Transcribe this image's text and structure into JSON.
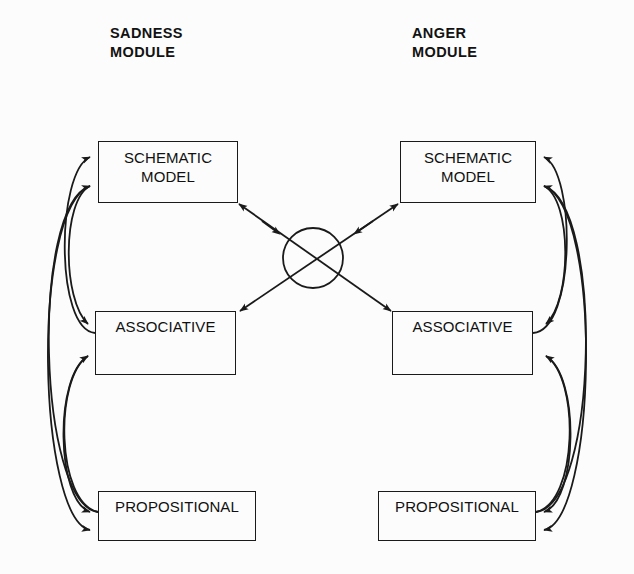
{
  "figure": {
    "background_color": "#fcfcfc",
    "stroke_color": "#1a1a1a",
    "text_color": "#101010"
  },
  "modules": {
    "left": {
      "title": "SADNESS\nMODULE",
      "nodes": {
        "schematic": "SCHEMATIC\nMODEL",
        "associative": "ASSOCIATIVE",
        "propositional": "PROPOSITIONAL"
      }
    },
    "right": {
      "title": "ANGER\nMODULE",
      "nodes": {
        "schematic": "SCHEMATIC\nMODEL",
        "associative": "ASSOCIATIVE",
        "propositional": "PROPOSITIONAL"
      }
    }
  },
  "crossing": {
    "label": "",
    "center_x": 313,
    "center_y": 258,
    "radius": 30
  },
  "diagram_data": {
    "type": "diagram",
    "title": "Sadness and Anger Module Interaction",
    "node_levels": [
      "SCHEMATIC MODEL",
      "ASSOCIATIVE",
      "PROPOSITIONAL"
    ],
    "nodes": [
      {
        "id": "L-SCHEMATIC",
        "module": "SADNESS",
        "label": "SCHEMATIC MODEL",
        "x": 98,
        "y": 141,
        "w": 140,
        "h": 62
      },
      {
        "id": "L-ASSOC",
        "module": "SADNESS",
        "label": "ASSOCIATIVE",
        "x": 95,
        "y": 311,
        "w": 141,
        "h": 64
      },
      {
        "id": "L-PROP",
        "module": "SADNESS",
        "label": "PROPOSITIONAL",
        "x": 98,
        "y": 491,
        "w": 158,
        "h": 50
      },
      {
        "id": "R-SCHEMATIC",
        "module": "ANGER",
        "label": "SCHEMATIC MODEL",
        "x": 400,
        "y": 141,
        "w": 136,
        "h": 62
      },
      {
        "id": "R-ASSOC",
        "module": "ANGER",
        "label": "ASSOCIATIVE",
        "x": 392,
        "y": 311,
        "w": 141,
        "h": 64
      },
      {
        "id": "R-PROP",
        "module": "ANGER",
        "label": "PROPOSITIONAL",
        "x": 378,
        "y": 491,
        "w": 158,
        "h": 50
      }
    ],
    "edges": [
      {
        "from": "L-ASSOC",
        "to": "L-SCHEMATIC",
        "style": "curved-arc",
        "side": "left"
      },
      {
        "from": "L-PROP",
        "to": "L-SCHEMATIC",
        "style": "curved-arc",
        "side": "left"
      },
      {
        "from": "L-SCHEMATIC",
        "to": "L-ASSOC",
        "style": "curved-arc",
        "side": "left"
      },
      {
        "from": "L-PROP",
        "to": "L-ASSOC",
        "style": "curved-arc",
        "side": "left"
      },
      {
        "from": "L-ASSOC",
        "to": "L-PROP",
        "style": "curved-arc",
        "side": "left"
      },
      {
        "from": "L-SCHEMATIC",
        "to": "L-PROP",
        "style": "curved-arc",
        "side": "left"
      },
      {
        "from": "R-ASSOC",
        "to": "R-SCHEMATIC",
        "style": "curved-arc",
        "side": "right"
      },
      {
        "from": "R-PROP",
        "to": "R-SCHEMATIC",
        "style": "curved-arc",
        "side": "right"
      },
      {
        "from": "R-SCHEMATIC",
        "to": "R-ASSOC",
        "style": "curved-arc",
        "side": "right"
      },
      {
        "from": "R-PROP",
        "to": "R-ASSOC",
        "style": "curved-arc",
        "side": "right"
      },
      {
        "from": "R-ASSOC",
        "to": "R-PROP",
        "style": "curved-arc",
        "side": "right"
      },
      {
        "from": "R-SCHEMATIC",
        "to": "R-PROP",
        "style": "curved-arc",
        "side": "right"
      },
      {
        "from": "R-ASSOC",
        "to": "L-SCHEMATIC",
        "style": "diagonal",
        "through": "crossing"
      },
      {
        "from": "L-SCHEMATIC",
        "to": "R-ASSOC",
        "style": "diagonal",
        "through": "crossing"
      },
      {
        "from": "L-ASSOC",
        "to": "R-SCHEMATIC",
        "style": "diagonal",
        "through": "crossing"
      },
      {
        "from": "R-SCHEMATIC",
        "to": "L-ASSOC",
        "style": "diagonal",
        "through": "crossing"
      }
    ]
  }
}
